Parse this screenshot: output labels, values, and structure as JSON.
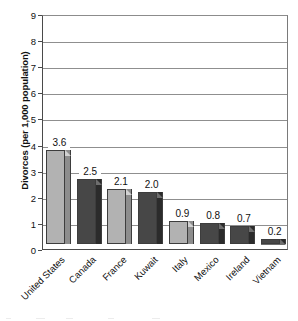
{
  "chart_data": {
    "type": "bar",
    "title": "",
    "subtitle": "",
    "xlabel": "",
    "ylabel": "Divorces (per 1,000 population)",
    "categories": [
      "United States",
      "Canada",
      "France",
      "Kuwait",
      "Italy",
      "Mexico",
      "Ireland",
      "Vietnam"
    ],
    "values": [
      3.6,
      2.5,
      2.1,
      2.0,
      0.9,
      0.8,
      0.7,
      0.2
    ],
    "data_labels": [
      "3.6",
      "2.5",
      "2.1",
      "2.0",
      "0.9",
      "0.8",
      "0.7",
      "0.2"
    ],
    "ylim": [
      0,
      9
    ],
    "ytick_values": [
      0,
      1,
      2,
      3,
      4,
      5,
      6,
      7,
      8,
      9
    ],
    "ytick_labels": [
      "0",
      "1",
      "2",
      "3",
      "4",
      "5",
      "6",
      "7",
      "8",
      "9"
    ],
    "ytick_step": 1,
    "grid": "horizontal",
    "legend": "none",
    "bar_style": "3d",
    "series": [
      {
        "name": "Divorces per 1,000 population",
        "values": [
          3.6,
          2.5,
          2.1,
          2.0,
          0.9,
          0.8,
          0.7,
          0.2
        ]
      }
    ],
    "bar_colors": [
      "light",
      "dark",
      "light",
      "dark",
      "light",
      "dark",
      "dark",
      "dark"
    ],
    "colors": {
      "light_face": "#b2b2b2",
      "light_top": "#d2d2d2",
      "light_side": "#8d8d8d",
      "dark_face": "#474747",
      "dark_top": "#6e6e6e",
      "dark_side": "#2b2b2b",
      "gridline": "#8f8f8f",
      "axis": "#4a4a4a",
      "text": "#111111",
      "background": "#ffffff"
    }
  }
}
